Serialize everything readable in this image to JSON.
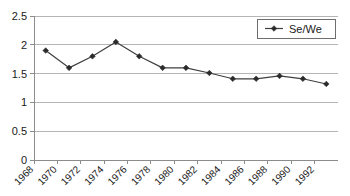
{
  "chart_data": {
    "type": "line",
    "title": "",
    "subtitle": "",
    "xlabel": "",
    "ylabel": "",
    "grid": true,
    "grid_axis": "y",
    "legend_position": "top-right",
    "xlim": [
      1968,
      1994
    ],
    "ylim": [
      0,
      2.5
    ],
    "y_ticks": [
      "0",
      "0.5",
      "1",
      "1.5",
      "2",
      "2.5"
    ],
    "y_tick_values": [
      0,
      0.5,
      1,
      1.5,
      2,
      2.5
    ],
    "x_ticks": [
      "1968",
      "1970",
      "1972",
      "1974",
      "1976",
      "1978",
      "1980",
      "1982",
      "1984",
      "1986",
      "1988",
      "1990",
      "1992"
    ],
    "x_tick_values": [
      1968,
      1970,
      1972,
      1974,
      1976,
      1978,
      1980,
      1982,
      1984,
      1986,
      1988,
      1990,
      1992
    ],
    "x_tick_rotation": -45,
    "x": [
      1969,
      1971,
      1973,
      1975,
      1977,
      1979,
      1981,
      1983,
      1985,
      1987,
      1989,
      1991,
      1993
    ],
    "series": [
      {
        "name": "Se/We",
        "marker": "diamond",
        "color": "#3f3f3f",
        "values": [
          1.9,
          1.6,
          1.8,
          2.05,
          1.8,
          1.6,
          1.6,
          1.51,
          1.41,
          1.41,
          1.46,
          1.41,
          1.32
        ]
      }
    ],
    "legend": [
      {
        "label": "Se/We",
        "marker": "diamond",
        "color": "#3f3f3f"
      }
    ],
    "colors": {
      "series_line": "#3f3f3f",
      "marker": "#2b2b2b",
      "gridline": "#b5b5b5",
      "axis": "#8c8c8c",
      "legend_border": "#6e6e6e",
      "background": "#ffffff",
      "text": "#1a1a1a"
    }
  }
}
